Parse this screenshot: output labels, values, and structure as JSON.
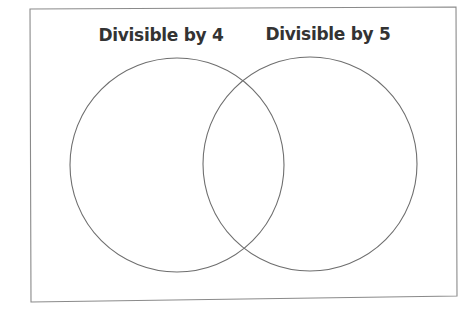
{
  "diagram": {
    "type": "venn",
    "sets": [
      {
        "id": "set-a",
        "label": "Divisible by 4",
        "members": []
      },
      {
        "id": "set-b",
        "label": "Divisible by 5",
        "members": []
      }
    ],
    "intersection": {
      "members": []
    },
    "outside": {
      "members": []
    },
    "colors": {
      "text": "#333333",
      "circle_stroke": "#6e6e6e",
      "frame_stroke": "#8a8a8a",
      "background": "#ffffff"
    }
  }
}
